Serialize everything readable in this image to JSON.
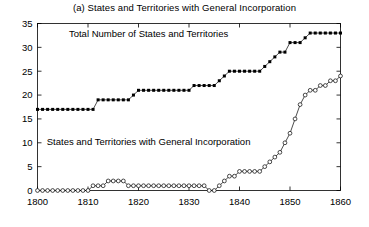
{
  "chart_data": {
    "type": "line",
    "title": "(a) States and Territories with General Incorporation",
    "xlabel": "",
    "ylabel": "",
    "xlim": [
      1800,
      1860
    ],
    "ylim": [
      0,
      35
    ],
    "xticks": [
      1800,
      1810,
      1820,
      1830,
      1840,
      1850,
      1860
    ],
    "xtick_labels": [
      "1800",
      "1810",
      "1820",
      "1830",
      "1840",
      "1850",
      "1860"
    ],
    "yticks": [
      0,
      5,
      10,
      15,
      20,
      25,
      30,
      35
    ],
    "ytick_labels": [
      "0",
      "5",
      "10",
      "15",
      "20",
      "25",
      "30",
      "35"
    ],
    "grid": false,
    "legend": "inline-annotations",
    "annotations": [
      {
        "text": "Total Number of States and Territories",
        "x": 1822,
        "y": 32.2
      },
      {
        "text": "States and Territories with General Incorporation",
        "x": 1822,
        "y": 9.6
      }
    ],
    "x": [
      1800,
      1801,
      1802,
      1803,
      1804,
      1805,
      1806,
      1807,
      1808,
      1809,
      1810,
      1811,
      1812,
      1813,
      1814,
      1815,
      1816,
      1817,
      1818,
      1819,
      1820,
      1821,
      1822,
      1823,
      1824,
      1825,
      1826,
      1827,
      1828,
      1829,
      1830,
      1831,
      1832,
      1833,
      1834,
      1835,
      1836,
      1837,
      1838,
      1839,
      1840,
      1841,
      1842,
      1843,
      1844,
      1845,
      1846,
      1847,
      1848,
      1849,
      1850,
      1851,
      1852,
      1853,
      1854,
      1855,
      1856,
      1857,
      1858,
      1859,
      1860
    ],
    "series": [
      {
        "name": "Total Number of States and Territories",
        "marker": "filled-square",
        "values": [
          17,
          17,
          17,
          17,
          17,
          17,
          17,
          17,
          17,
          17,
          17,
          17,
          19,
          19,
          19,
          19,
          19,
          19,
          19,
          20,
          21,
          21,
          21,
          21,
          21,
          21,
          21,
          21,
          21,
          21,
          21,
          22,
          22,
          22,
          22,
          22,
          23,
          24,
          25,
          25,
          25,
          25,
          25,
          25,
          25,
          26,
          27,
          28,
          29,
          29,
          31,
          31,
          31,
          32,
          33,
          33,
          33,
          33,
          33,
          33,
          33
        ]
      },
      {
        "name": "States and Territories with General Incorporation",
        "marker": "open-circle",
        "values": [
          0,
          0,
          0,
          0,
          0,
          0,
          0,
          0,
          0,
          0,
          0,
          1,
          1,
          1,
          2,
          2,
          2,
          2,
          1,
          1,
          1,
          1,
          1,
          1,
          1,
          1,
          1,
          1,
          1,
          1,
          1,
          1,
          1,
          1,
          0,
          0,
          1,
          2,
          3,
          3,
          4,
          4,
          4,
          4,
          4,
          5,
          6,
          7,
          8,
          10,
          12,
          15,
          18,
          20,
          21,
          21,
          22,
          22,
          23,
          23,
          24
        ]
      }
    ]
  }
}
